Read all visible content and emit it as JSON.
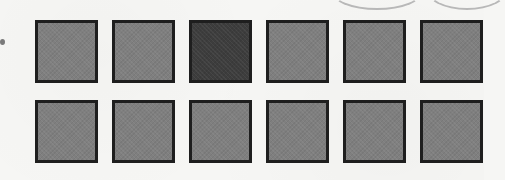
{
  "figure": {
    "rows": 2,
    "columns": 6,
    "colors": {
      "light_fill": "#7f7f7f",
      "dark_fill": "#3d3d3d",
      "border": "#1e1e1e",
      "background": "#f6f6f4"
    },
    "squares": [
      {
        "row": 1,
        "col": 1,
        "shade": "light"
      },
      {
        "row": 1,
        "col": 2,
        "shade": "light"
      },
      {
        "row": 1,
        "col": 3,
        "shade": "dark"
      },
      {
        "row": 1,
        "col": 4,
        "shade": "light"
      },
      {
        "row": 1,
        "col": 5,
        "shade": "light"
      },
      {
        "row": 1,
        "col": 6,
        "shade": "light"
      },
      {
        "row": 2,
        "col": 1,
        "shade": "light"
      },
      {
        "row": 2,
        "col": 2,
        "shade": "light"
      },
      {
        "row": 2,
        "col": 3,
        "shade": "light"
      },
      {
        "row": 2,
        "col": 4,
        "shade": "light"
      },
      {
        "row": 2,
        "col": 5,
        "shade": "light"
      },
      {
        "row": 2,
        "col": 6,
        "shade": "light"
      }
    ],
    "counts": {
      "total": 12,
      "shaded_dark": 1,
      "light": 11
    }
  }
}
